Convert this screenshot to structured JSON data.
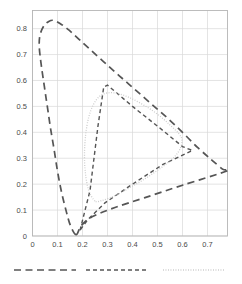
{
  "chart_data": {
    "type": "line",
    "title": "",
    "subtitle": "",
    "xlabel": "",
    "ylabel": "",
    "xlim": [
      0,
      0.78
    ],
    "ylim": [
      0,
      0.87
    ],
    "grid": true,
    "legend_position": "bottom",
    "xticks": [
      "0",
      "0.1",
      "0.2",
      "0.3",
      "0.4",
      "0.5",
      "0.6",
      "0.7"
    ],
    "xtick_values": [
      0,
      0.1,
      0.2,
      0.3,
      0.4,
      0.5,
      0.6,
      0.7
    ],
    "yticks": [
      "0",
      "0.1",
      "0.2",
      "0.3",
      "0.4",
      "0.5",
      "0.6",
      "0.7",
      "0.8"
    ],
    "ytick_values": [
      0,
      0.1,
      0.2,
      0.3,
      0.4,
      0.5,
      0.6,
      0.7,
      0.8
    ],
    "series": [
      {
        "name": "spectral-locus",
        "style": "long-dash",
        "color": "#555555",
        "closed": true,
        "points": [
          [
            0.175,
            0.005
          ],
          [
            0.152,
            0.04
          ],
          [
            0.135,
            0.095
          ],
          [
            0.116,
            0.17
          ],
          [
            0.1,
            0.25
          ],
          [
            0.087,
            0.33
          ],
          [
            0.073,
            0.41
          ],
          [
            0.06,
            0.495
          ],
          [
            0.047,
            0.58
          ],
          [
            0.035,
            0.66
          ],
          [
            0.027,
            0.73
          ],
          [
            0.03,
            0.775
          ],
          [
            0.045,
            0.81
          ],
          [
            0.065,
            0.828
          ],
          [
            0.085,
            0.832
          ],
          [
            0.11,
            0.82
          ],
          [
            0.145,
            0.795
          ],
          [
            0.185,
            0.76
          ],
          [
            0.23,
            0.72
          ],
          [
            0.285,
            0.672
          ],
          [
            0.345,
            0.62
          ],
          [
            0.41,
            0.565
          ],
          [
            0.475,
            0.51
          ],
          [
            0.54,
            0.455
          ],
          [
            0.6,
            0.4
          ],
          [
            0.66,
            0.342
          ],
          [
            0.715,
            0.295
          ],
          [
            0.76,
            0.258
          ],
          [
            0.775,
            0.25
          ],
          [
            0.6,
            0.196
          ],
          [
            0.45,
            0.148
          ],
          [
            0.33,
            0.11
          ],
          [
            0.24,
            0.075
          ],
          [
            0.195,
            0.04
          ],
          [
            0.175,
            0.005
          ]
        ]
      },
      {
        "name": "gamut-triangle",
        "style": "medium-dash",
        "color": "#555555",
        "closed": true,
        "points": [
          [
            0.19,
            0.022
          ],
          [
            0.23,
            0.175
          ],
          [
            0.262,
            0.425
          ],
          [
            0.285,
            0.575
          ],
          [
            0.3,
            0.582
          ],
          [
            0.4,
            0.5
          ],
          [
            0.505,
            0.42
          ],
          [
            0.6,
            0.345
          ],
          [
            0.64,
            0.33
          ],
          [
            0.52,
            0.275
          ],
          [
            0.4,
            0.2
          ],
          [
            0.29,
            0.128
          ],
          [
            0.22,
            0.062
          ],
          [
            0.19,
            0.022
          ]
        ]
      },
      {
        "name": "device-gamut-rounded",
        "style": "dotted",
        "color": "#c9c9c9",
        "closed": true,
        "points": [
          [
            0.25,
            0.135
          ],
          [
            0.225,
            0.175
          ],
          [
            0.212,
            0.24
          ],
          [
            0.208,
            0.31
          ],
          [
            0.212,
            0.385
          ],
          [
            0.224,
            0.455
          ],
          [
            0.244,
            0.508
          ],
          [
            0.27,
            0.54
          ],
          [
            0.3,
            0.552
          ],
          [
            0.34,
            0.55
          ],
          [
            0.39,
            0.533
          ],
          [
            0.445,
            0.505
          ],
          [
            0.5,
            0.47
          ],
          [
            0.548,
            0.43
          ],
          [
            0.585,
            0.395
          ],
          [
            0.598,
            0.37
          ],
          [
            0.592,
            0.34
          ],
          [
            0.572,
            0.31
          ],
          [
            0.54,
            0.282
          ],
          [
            0.495,
            0.25
          ],
          [
            0.445,
            0.218
          ],
          [
            0.395,
            0.19
          ],
          [
            0.35,
            0.165
          ],
          [
            0.308,
            0.147
          ],
          [
            0.275,
            0.136
          ],
          [
            0.25,
            0.135
          ]
        ]
      }
    ],
    "legend_entries": [
      {
        "label": "",
        "style": "long-dash",
        "color": "#555555"
      },
      {
        "label": "",
        "style": "medium-dash",
        "color": "#555555"
      },
      {
        "label": "",
        "style": "dotted",
        "color": "#c9c9c9"
      }
    ]
  }
}
